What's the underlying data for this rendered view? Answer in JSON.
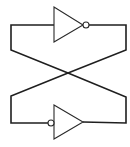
{
  "diagram": {
    "components": [
      {
        "id": "inverter-top",
        "type": "NOT gate",
        "orientation": "right",
        "bubble": "output"
      },
      {
        "id": "inverter-bottom",
        "type": "NOT gate",
        "orientation": "right",
        "bubble": "input"
      }
    ],
    "connections": [
      {
        "from": "inverter-top.output",
        "to": "inverter-bottom.output",
        "route": "right loop, crossing"
      },
      {
        "from": "inverter-top.input",
        "to": "inverter-bottom.input",
        "route": "left loop, crossing"
      }
    ],
    "colors": {
      "line": "#1f1f1f",
      "background": "#ffffff"
    }
  }
}
